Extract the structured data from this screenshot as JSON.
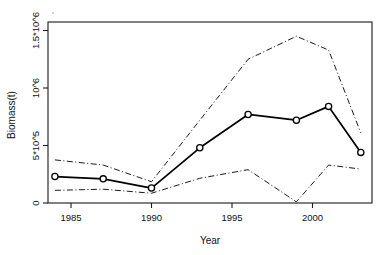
{
  "chart_data": {
    "type": "line",
    "title": "",
    "xlabel": "Year",
    "ylabel": "Biomass(t)",
    "xlim": [
      1983,
      2004
    ],
    "ylim": [
      0,
      1600000
    ],
    "grid": false,
    "legend": false,
    "x": [
      1984,
      1987,
      1990,
      1993,
      1996,
      1999,
      2001,
      2003
    ],
    "series": [
      {
        "name": "Biomass estimate",
        "style": "solid-with-open-circle-markers",
        "values": [
          230000,
          210000,
          130000,
          480000,
          770000,
          720000,
          840000,
          440000
        ]
      },
      {
        "name": "Upper confidence bound",
        "style": "dash-dot",
        "values": [
          375000,
          330000,
          185000,
          720000,
          1250000,
          1450000,
          1330000,
          610000
        ]
      },
      {
        "name": "Lower confidence bound",
        "style": "dash-dot",
        "values": [
          110000,
          120000,
          85000,
          215000,
          290000,
          10000,
          330000,
          295000
        ]
      }
    ],
    "xticks": [
      1985,
      1990,
      1995,
      2000
    ],
    "xtick_labels": [
      "1985",
      "1990",
      "1995",
      "2000"
    ],
    "yticks": [
      0,
      500000,
      1000000,
      1500000
    ],
    "ytick_labels": [
      "0",
      "5*10^5",
      "10^6",
      "1.5*10^6"
    ]
  },
  "axes": {
    "y_title": "Biomass(t)",
    "x_title": "Year",
    "y_labels": {
      "t0": "0",
      "t1": "5*10^5",
      "t2": "10^6",
      "t3": "1.5*10^6"
    },
    "x_labels": {
      "t0": "1985",
      "t1": "1990",
      "t2": "1995",
      "t3": "2000"
    }
  }
}
